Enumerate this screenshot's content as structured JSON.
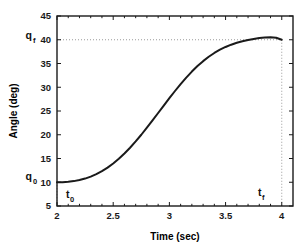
{
  "chart_data": {
    "type": "line",
    "title": "",
    "xlabel": "Time (sec)",
    "ylabel": "Angle (deg)",
    "xlim": [
      2,
      4.1
    ],
    "ylim": [
      5,
      45
    ],
    "xticks": [
      "2",
      "2.5",
      "3",
      "3.5",
      "4"
    ],
    "xtick_values": [
      2,
      2.5,
      3,
      3.5,
      4
    ],
    "yticks": [
      "5",
      "10",
      "15",
      "20",
      "25",
      "30",
      "35",
      "40",
      "45"
    ],
    "ytick_values": [
      5,
      10,
      15,
      20,
      25,
      30,
      35,
      40,
      45
    ],
    "grid": false,
    "legend": "none",
    "line_color": "#1a1a1a",
    "guide_color": "#999999",
    "x": [
      2.0,
      2.05,
      2.1,
      2.15,
      2.2,
      2.25,
      2.3,
      2.35,
      2.4,
      2.45,
      2.5,
      2.55,
      2.6,
      2.65,
      2.7,
      2.75,
      2.8,
      2.85,
      2.9,
      2.95,
      3.0,
      3.05,
      3.1,
      3.15,
      3.2,
      3.25,
      3.3,
      3.35,
      3.4,
      3.45,
      3.5,
      3.55,
      3.6,
      3.65,
      3.7,
      3.75,
      3.8,
      3.85,
      3.9,
      3.95,
      4.0
    ],
    "y": [
      10.0,
      10.02,
      10.1,
      10.24,
      10.46,
      10.77,
      11.18,
      11.7,
      12.33,
      13.08,
      13.95,
      14.94,
      16.05,
      17.27,
      18.59,
      20.0,
      21.48,
      23.02,
      24.58,
      26.15,
      27.7,
      29.21,
      30.66,
      32.03,
      33.3,
      34.46,
      35.5,
      36.42,
      37.22,
      37.9,
      38.48,
      38.96,
      39.36,
      39.69,
      39.96,
      40.18,
      40.36,
      40.48,
      40.52,
      40.42,
      40.0
    ],
    "annotations": [
      {
        "name": "q_f",
        "base": "q",
        "sub": "f",
        "axis": "y",
        "value": 40,
        "note": "final angle guide label on y-axis"
      },
      {
        "name": "q_0",
        "base": "q",
        "sub": "0",
        "axis": "y",
        "value": 10,
        "note": "initial angle guide label on y-axis"
      },
      {
        "name": "t_0",
        "base": "t",
        "sub": "0",
        "axis": "x",
        "value": 2,
        "note": "start time guide label"
      },
      {
        "name": "t_f",
        "base": "t",
        "sub": "f",
        "axis": "x",
        "value": 4,
        "note": "final time guide label"
      }
    ],
    "guides": [
      {
        "type": "hline",
        "value": 40,
        "style": "dotted"
      },
      {
        "type": "vline",
        "value": 2,
        "style": "dotted"
      },
      {
        "type": "vline",
        "value": 4,
        "style": "dotted"
      }
    ]
  }
}
